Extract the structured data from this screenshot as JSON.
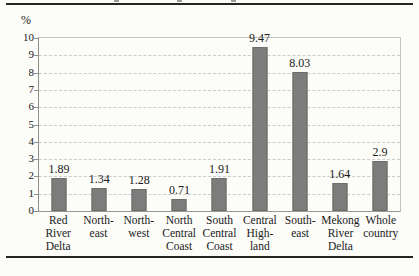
{
  "chart_data": {
    "type": "bar",
    "unit_label": "%",
    "categories": [
      "Red River Delta",
      "North-east",
      "North-west",
      "North Central Coast",
      "South Central Coast",
      "Central High-land",
      "South-east",
      "Mekong River Delta",
      "Whole country"
    ],
    "category_lines": [
      [
        "Red",
        "River",
        "Delta"
      ],
      [
        "North-",
        "east"
      ],
      [
        "North-",
        "west"
      ],
      [
        "North",
        "Central",
        "Coast"
      ],
      [
        "South",
        "Central",
        "Coast"
      ],
      [
        "Central",
        "High-",
        "land"
      ],
      [
        "South-",
        "east"
      ],
      [
        "Mekong",
        "River",
        "Delta"
      ],
      [
        "Whole",
        "country"
      ]
    ],
    "values": [
      1.89,
      1.34,
      1.28,
      0.71,
      1.91,
      9.47,
      8.03,
      1.64,
      2.9
    ],
    "value_labels": [
      "1.89",
      "1.34",
      "1.28",
      "0.71",
      "1.91",
      "9.47",
      "8.03",
      "1.64",
      "2.9"
    ],
    "y_ticks": [
      0,
      1,
      2,
      3,
      4,
      5,
      6,
      7,
      8,
      9,
      10
    ],
    "ylim": [
      0,
      10
    ],
    "grid": "horizontal-dashed",
    "legend": "none",
    "bar_color": "#7c7c7c"
  }
}
